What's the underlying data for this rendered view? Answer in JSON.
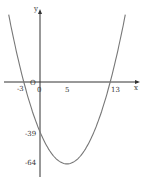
{
  "chart_data": {
    "type": "line",
    "title": "",
    "xlabel": "x",
    "ylabel": "y",
    "function": "y = x^2 - 10x - 39",
    "series": [
      {
        "name": "parabola",
        "x": [
          -6,
          -3,
          0,
          5,
          10,
          13,
          16
        ],
        "y": [
          57,
          0,
          -39,
          -64,
          -39,
          0,
          57
        ]
      }
    ],
    "key_points": [
      {
        "label": "-3",
        "x": -3,
        "y": 0
      },
      {
        "label": "13",
        "x": 13,
        "y": 0
      },
      {
        "label": "-39",
        "x": 0,
        "y": -39
      },
      {
        "label": "-64",
        "x": 5,
        "y": -64
      }
    ],
    "x_tick_labels": [
      "-3",
      "O",
      "0",
      "5",
      "13"
    ],
    "y_tick_labels": [
      "-39",
      "-64"
    ],
    "grid": false,
    "curve_color": "#777777",
    "axis_color": "#333333"
  },
  "labels": {
    "x_axis": "x",
    "y_axis": "y",
    "origin": "O",
    "zero": "0",
    "neg3": "-3",
    "five": "5",
    "thirteen": "13",
    "neg39": "-39",
    "neg64": "-64"
  }
}
